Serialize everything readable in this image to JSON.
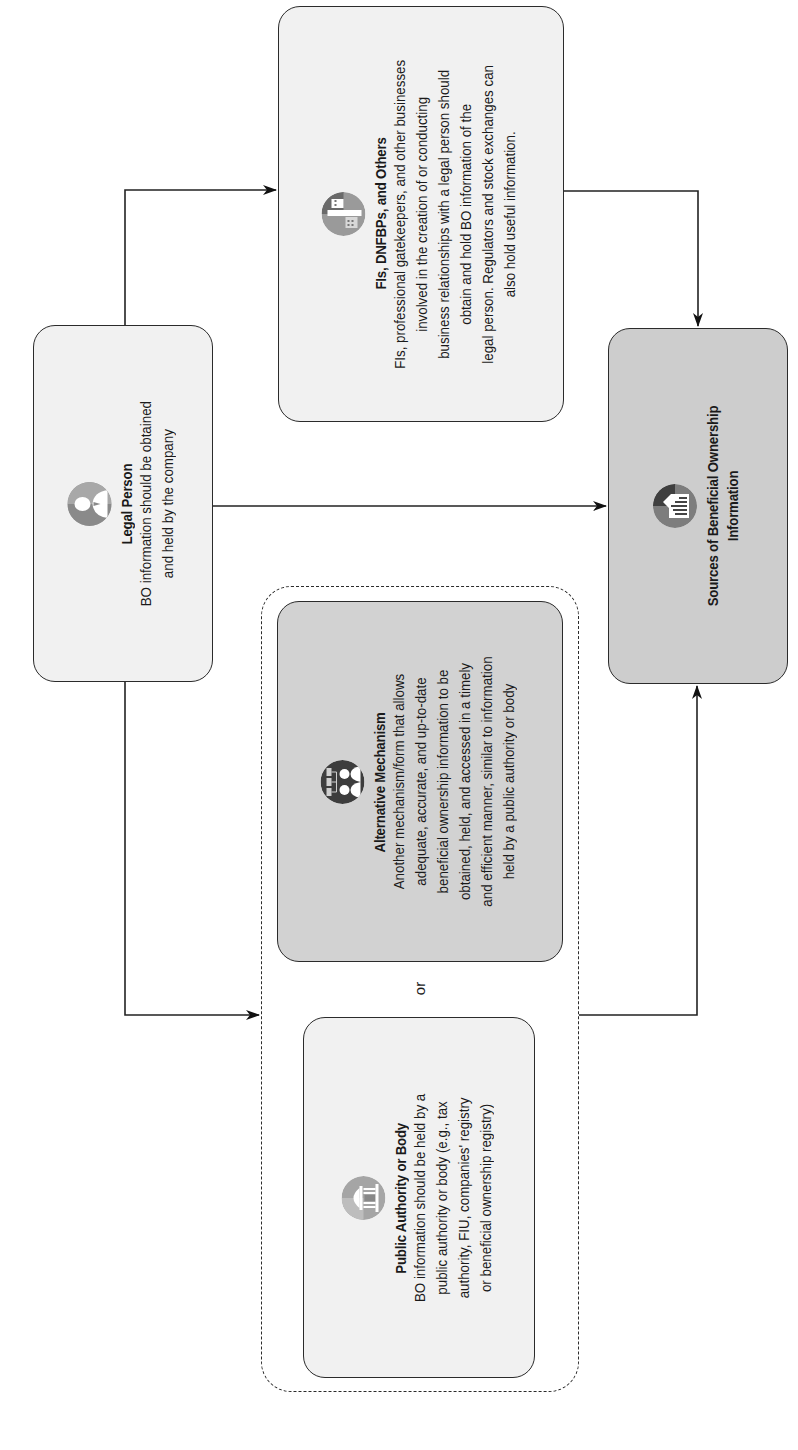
{
  "diagram": {
    "orientation": "rotated-90-ccw",
    "nodes": {
      "legal_person": {
        "title": "Legal Person",
        "icon": "person-icon",
        "lines": [
          "BO information should be obtained",
          "and held by the company"
        ]
      },
      "fis": {
        "title": "FIs, DNFBPs, and Others",
        "icon": "buildings-icon",
        "lines": [
          "FIs, professional gatekeepers, and other businesses",
          "involved in the creation of or conducting",
          "business relationships with a legal person should",
          "obtain and hold BO information of the",
          "legal person. Regulators and stock exchanges can",
          "also hold useful information."
        ]
      },
      "sources": {
        "title_lines": [
          "Sources of Beneficial Ownership",
          "Information"
        ],
        "icon": "document-chart-icon"
      },
      "alternative": {
        "title": "Alternative Mechanism",
        "icon": "people-network-icon",
        "lines": [
          "Another mechanism/form that allows",
          "adequate, accurate, and up-to-date",
          "beneficial ownership information to be",
          "obtained, held, and accessed in a timely",
          "and efficient manner, similar to information",
          "held by a public authority or body"
        ]
      },
      "public_authority": {
        "title": "Public Authority or Body",
        "icon": "government-building-icon",
        "lines": [
          "BO information should be held by a",
          "public authority or body (e.g., tax",
          "authority, FIU, companies' registry",
          "or beneficial ownership registry)"
        ]
      }
    },
    "or_label": "or",
    "edges": [
      {
        "from": "Legal Person",
        "to": "FIs, DNFBPs, and Others"
      },
      {
        "from": "Legal Person",
        "to": "Sources of Beneficial Ownership Information"
      },
      {
        "from": "Legal Person",
        "to": "Public Authority or Body / Alternative Mechanism group"
      },
      {
        "from": "FIs, DNFBPs, and Others",
        "to": "Sources of Beneficial Ownership Information"
      },
      {
        "from": "Public Authority or Body / Alternative Mechanism group",
        "to": "Sources of Beneficial Ownership Information"
      }
    ],
    "colors": {
      "light_box": "#f1f1f1",
      "mid_box": "#d2d2d2",
      "stroke": "#2b2b2b",
      "icon_gray": "#9a9a9a",
      "icon_dark": "#555555"
    }
  }
}
